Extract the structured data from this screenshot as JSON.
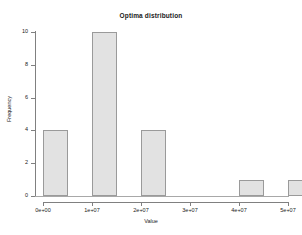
{
  "chart_data": {
    "type": "bar",
    "title": "Optima distribution",
    "xlabel": "Value",
    "ylabel": "Frequency",
    "grid": false,
    "legend": null,
    "xlim": [
      0,
      52000000
    ],
    "ylim": [
      0,
      10
    ],
    "x_tick_labels": [
      "0e+00",
      "1e+07",
      "2e+07",
      "3e+07",
      "4e+07",
      "5e+07"
    ],
    "x_tick_values": [
      0,
      10000000,
      20000000,
      30000000,
      40000000,
      50000000
    ],
    "y_tick_labels": [
      "0",
      "2",
      "4",
      "6",
      "8",
      "10"
    ],
    "y_tick_values": [
      0,
      2,
      4,
      6,
      8,
      10
    ],
    "bin_width": 5000000,
    "bins": [
      {
        "label": "0e+00",
        "bin_start": 0,
        "bin_end": 5000000,
        "value": 4
      },
      {
        "label": "1e+07",
        "bin_start": 10000000,
        "bin_end": 15000000,
        "value": 10
      },
      {
        "label": "2e+07",
        "bin_start": 20000000,
        "bin_end": 25000000,
        "value": 4
      },
      {
        "label": "4e+07",
        "bin_start": 40000000,
        "bin_end": 45000000,
        "value": 1
      },
      {
        "label": "5e+07",
        "bin_start": 50000000,
        "bin_end": 55000000,
        "value": 1
      }
    ],
    "categories": [
      "0e+00",
      "1e+07",
      "2e+07",
      "4e+07",
      "5e+07"
    ],
    "values": [
      4,
      10,
      4,
      1,
      1
    ],
    "colors": {
      "bar_fill": "#e2e2e2",
      "bar_border": "#9a9a9a",
      "axis": "#808080",
      "text": "#1a1a1a",
      "background": "#ffffff"
    }
  }
}
